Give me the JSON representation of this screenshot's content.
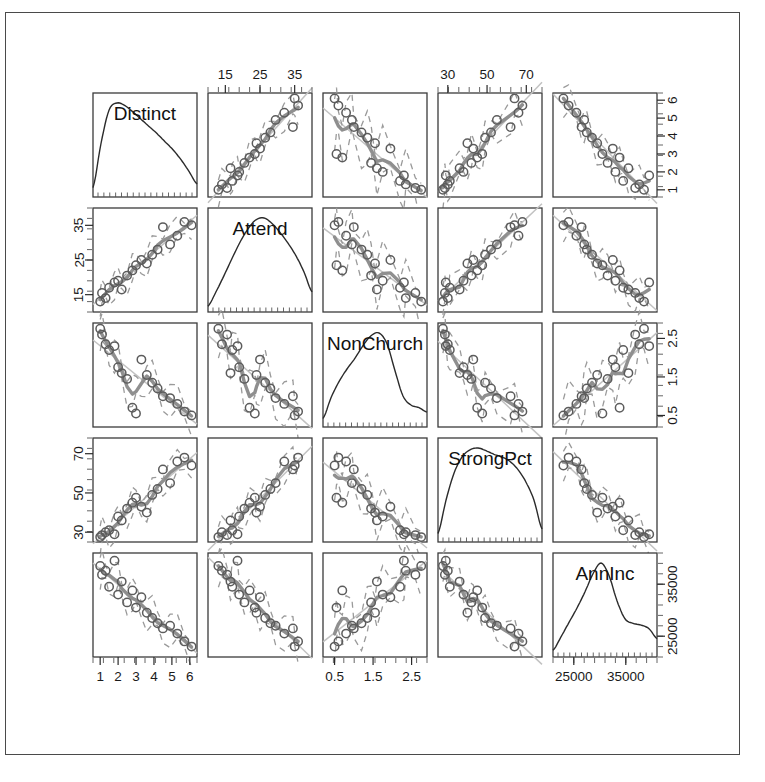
{
  "figure": {
    "type": "scatterplot-matrix",
    "title": "",
    "variables": [
      "Distinct",
      "Attend",
      "NonChurch",
      "StrongPct",
      "AnnInc"
    ],
    "n_points": 19,
    "frame": {
      "border_color": "#4a4a4a"
    },
    "colors": {
      "point": "#5c5c5c",
      "smoother": "#8f8f8f",
      "band": "#9a9a9a",
      "regression": "#c2c2c2",
      "density": "#2b2b2b",
      "axis": "#2a2a2a"
    }
  },
  "axes": {
    "top": [
      {
        "col": 2,
        "variable": "Attend",
        "labels": [
          "15",
          "25",
          "35"
        ],
        "values": [
          15,
          25,
          35
        ],
        "range": [
          10,
          40
        ]
      },
      {
        "col": 4,
        "variable": "StrongPct",
        "labels": [
          "30",
          "50",
          "70"
        ],
        "values": [
          30,
          50,
          70
        ],
        "range": [
          25,
          78
        ]
      }
    ],
    "bottom": [
      {
        "col": 1,
        "variable": "Distinct",
        "labels": [
          "1",
          "2",
          "3",
          "4",
          "5",
          "6"
        ],
        "values": [
          1,
          2,
          3,
          4,
          5,
          6
        ],
        "range": [
          0.6,
          6.4
        ]
      },
      {
        "col": 3,
        "variable": "NonChurch",
        "labels": [
          "0.5",
          "1.5",
          "2.5"
        ],
        "values": [
          0.5,
          1.5,
          2.5
        ],
        "range": [
          0.2,
          2.9
        ]
      },
      {
        "col": 5,
        "variable": "AnnInc",
        "labels": [
          "25000",
          "35000"
        ],
        "values": [
          25000,
          35000
        ],
        "range": [
          21000,
          41000
        ]
      }
    ],
    "left": [
      {
        "row": 2,
        "variable": "Attend",
        "labels": [
          "15",
          "25",
          "35"
        ],
        "values": [
          15,
          25,
          35
        ],
        "range": [
          10,
          40
        ]
      },
      {
        "row": 4,
        "variable": "StrongPct",
        "labels": [
          "30",
          "50",
          "70"
        ],
        "values": [
          30,
          50,
          70
        ],
        "range": [
          25,
          78
        ]
      }
    ],
    "right": [
      {
        "row": 1,
        "variable": "Distinct",
        "labels": [
          "1",
          "2",
          "3",
          "4",
          "5",
          "6"
        ],
        "values": [
          1,
          2,
          3,
          4,
          5,
          6
        ],
        "range": [
          0.6,
          6.4
        ]
      },
      {
        "row": 3,
        "variable": "NonChurch",
        "labels": [
          "0.5",
          "1.5",
          "2.5"
        ],
        "values": [
          0.5,
          1.5,
          2.5
        ],
        "range": [
          0.2,
          2.9
        ]
      },
      {
        "row": 5,
        "variable": "AnnInc",
        "labels": [
          "25000",
          "35000"
        ],
        "values": [
          25000,
          35000
        ],
        "range": [
          21000,
          41000
        ]
      }
    ]
  },
  "chart_data": {
    "type": "scatter",
    "plot_kind": "scatterplot matrix (pairs) with density diagonal and lowess smoothers",
    "title": "",
    "xlabel": "",
    "ylabel": "",
    "grid": false,
    "legend": "none",
    "variables": [
      {
        "name": "Distinct",
        "range": [
          0.6,
          6.4
        ],
        "ticks": [
          1,
          2,
          3,
          4,
          5,
          6
        ]
      },
      {
        "name": "Attend",
        "range": [
          10,
          40
        ],
        "ticks": [
          15,
          25,
          35
        ]
      },
      {
        "name": "NonChurch",
        "range": [
          0.2,
          2.9
        ],
        "ticks": [
          0.5,
          1.5,
          2.5
        ]
      },
      {
        "name": "StrongPct",
        "range": [
          25,
          78
        ],
        "ticks": [
          30,
          50,
          70
        ]
      },
      {
        "name": "AnnInc",
        "range": [
          21000,
          41000
        ],
        "ticks": [
          25000,
          35000
        ]
      }
    ],
    "observations": [
      {
        "Distinct": 1.0,
        "Attend": 13.0,
        "NonChurch": 2.75,
        "StrongPct": 27.5,
        "AnnInc": 38500
      },
      {
        "Distinct": 1.1,
        "Attend": 15.5,
        "NonChurch": 2.6,
        "StrongPct": 28.5,
        "AnnInc": 36800
      },
      {
        "Distinct": 1.3,
        "Attend": 14.0,
        "NonChurch": 2.35,
        "StrongPct": 30.0,
        "AnnInc": 37600
      },
      {
        "Distinct": 1.5,
        "Attend": 17.0,
        "NonChurch": 2.2,
        "StrongPct": 31.0,
        "AnnInc": 34500
      },
      {
        "Distinct": 1.8,
        "Attend": 18.5,
        "NonChurch": 2.3,
        "StrongPct": 29.0,
        "AnnInc": 39500
      },
      {
        "Distinct": 2.0,
        "Attend": 19.0,
        "NonChurch": 1.75,
        "StrongPct": 38.0,
        "AnnInc": 33000
      },
      {
        "Distinct": 2.2,
        "Attend": 16.5,
        "NonChurch": 1.6,
        "StrongPct": 36.0,
        "AnnInc": 35500
      },
      {
        "Distinct": 2.5,
        "Attend": 20.5,
        "NonChurch": 1.45,
        "StrongPct": 42.0,
        "AnnInc": 31500
      },
      {
        "Distinct": 2.8,
        "Attend": 22.0,
        "NonChurch": 0.7,
        "StrongPct": 45.0,
        "AnnInc": 33800
      },
      {
        "Distinct": 3.0,
        "Attend": 23.5,
        "NonChurch": 0.55,
        "StrongPct": 47.5,
        "AnnInc": 30500
      },
      {
        "Distinct": 3.3,
        "Attend": 25.0,
        "NonChurch": 1.95,
        "StrongPct": 43.0,
        "AnnInc": 32500
      },
      {
        "Distinct": 3.6,
        "Attend": 24.0,
        "NonChurch": 1.55,
        "StrongPct": 40.0,
        "AnnInc": 29500
      },
      {
        "Distinct": 3.9,
        "Attend": 26.5,
        "NonChurch": 1.35,
        "StrongPct": 49.0,
        "AnnInc": 28500
      },
      {
        "Distinct": 4.2,
        "Attend": 28.0,
        "NonChurch": 1.2,
        "StrongPct": 52.0,
        "AnnInc": 27500
      },
      {
        "Distinct": 4.5,
        "Attend": 34.5,
        "NonChurch": 1.0,
        "StrongPct": 62.0,
        "AnnInc": 26500
      },
      {
        "Distinct": 4.9,
        "Attend": 29.5,
        "NonChurch": 0.95,
        "StrongPct": 55.0,
        "AnnInc": 27000
      },
      {
        "Distinct": 5.3,
        "Attend": 32.0,
        "NonChurch": 0.8,
        "StrongPct": 66.0,
        "AnnInc": 25500
      },
      {
        "Distinct": 5.7,
        "Attend": 36.0,
        "NonChurch": 0.6,
        "StrongPct": 68.0,
        "AnnInc": 24000
      },
      {
        "Distinct": 6.1,
        "Attend": 35.0,
        "NonChurch": 0.5,
        "StrongPct": 64.0,
        "AnnInc": 23000
      }
    ],
    "diagonal_densities": {
      "Distinct": [
        0.06,
        0.55,
        0.92,
        1.0,
        0.97,
        0.9,
        0.82,
        0.74,
        0.66,
        0.57,
        0.48,
        0.37,
        0.24,
        0.1
      ],
      "Attend": [
        0.02,
        0.18,
        0.36,
        0.55,
        0.73,
        0.88,
        0.98,
        1.0,
        0.94,
        0.84,
        0.72,
        0.58,
        0.4,
        0.18
      ],
      "NonChurch": [
        0.05,
        0.28,
        0.46,
        0.6,
        0.72,
        0.86,
        0.97,
        1.0,
        0.88,
        0.58,
        0.3,
        0.2,
        0.17,
        0.12
      ],
      "StrongPct": [
        0.05,
        0.42,
        0.72,
        0.9,
        0.98,
        1.0,
        0.97,
        0.93,
        0.9,
        0.85,
        0.76,
        0.62,
        0.42,
        0.1
      ],
      "AnnInc": [
        0.03,
        0.18,
        0.34,
        0.5,
        0.68,
        0.88,
        1.0,
        0.86,
        0.58,
        0.38,
        0.33,
        0.31,
        0.27,
        0.16
      ]
    },
    "panel_relationships": [
      {
        "x": "Attend",
        "y": "Distinct",
        "direction": "positive",
        "strength": "strong"
      },
      {
        "x": "NonChurch",
        "y": "Distinct",
        "direction": "negative",
        "strength": "strong"
      },
      {
        "x": "StrongPct",
        "y": "Distinct",
        "direction": "positive",
        "strength": "strong"
      },
      {
        "x": "AnnInc",
        "y": "Distinct",
        "direction": "negative",
        "strength": "moderate"
      },
      {
        "x": "NonChurch",
        "y": "Attend",
        "direction": "negative",
        "strength": "strong"
      },
      {
        "x": "StrongPct",
        "y": "Attend",
        "direction": "positive",
        "strength": "strong"
      },
      {
        "x": "AnnInc",
        "y": "Attend",
        "direction": "negative",
        "strength": "moderate"
      },
      {
        "x": "StrongPct",
        "y": "NonChurch",
        "direction": "negative",
        "strength": "moderate"
      },
      {
        "x": "AnnInc",
        "y": "NonChurch",
        "direction": "positive",
        "strength": "moderate"
      },
      {
        "x": "AnnInc",
        "y": "StrongPct",
        "direction": "negative",
        "strength": "moderate"
      }
    ]
  }
}
